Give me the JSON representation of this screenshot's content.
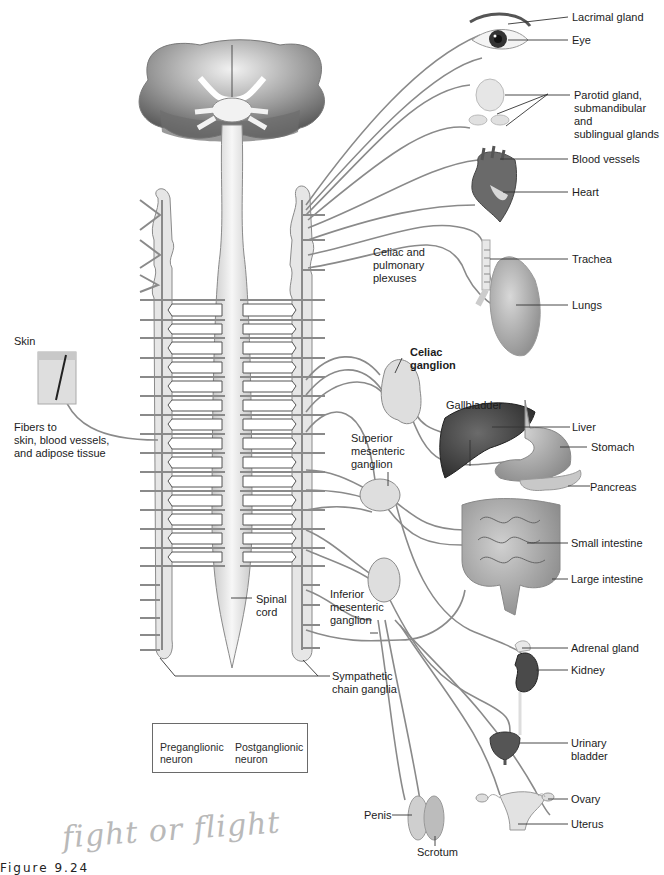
{
  "figure": {
    "caption": "Figure 9.24",
    "handwritten_note": "fight or flight"
  },
  "labels": {
    "lacrimal_gland": "Lacrimal gland",
    "eye": "Eye",
    "salivary_glands": "Parotid gland,\nsubmandibular and\nsublingual glands",
    "blood_vessels": "Blood vessels",
    "heart": "Heart",
    "celiac_pulmonary": "Celiac and\npulmonary\nplexuses",
    "trachea": "Trachea",
    "lungs": "Lungs",
    "skin": "Skin",
    "skin_fibers": "Fibers to\nskin, blood vessels,\nand adipose tissue",
    "celiac_ganglion": "Celiac\nganglion",
    "gallbladder": "Gallbladder",
    "liver": "Liver",
    "stomach": "Stomach",
    "superior_mesenteric": "Superior\nmesenteric\nganglion",
    "pancreas": "Pancreas",
    "small_intestine": "Small intestine",
    "large_intestine": "Large intestine",
    "spinal_cord": "Spinal\ncord",
    "inferior_mesenteric": "Inferior\nmesenteric\nganglion",
    "adrenal_gland": "Adrenal gland",
    "kidney": "Kidney",
    "sympathetic_chain": "Sympathetic\nchain ganglia",
    "urinary_bladder": "Urinary\nbladder",
    "ovary": "Ovary",
    "uterus": "Uterus",
    "penis": "Penis",
    "scrotum": "Scrotum"
  },
  "legend": {
    "preganglionic": "Preganglionic\nneuron",
    "postganglionic": "Postganglionic\nneuron"
  },
  "colors": {
    "nerve": "#8a8a8a",
    "chain_fill": "#e6e6e6",
    "organ_dark": "#4a4a4a",
    "organ_mid": "#9a9a9a",
    "organ_light": "#cfcfcf",
    "label_text": "#1c1c1c",
    "leader_line": "#333333"
  }
}
